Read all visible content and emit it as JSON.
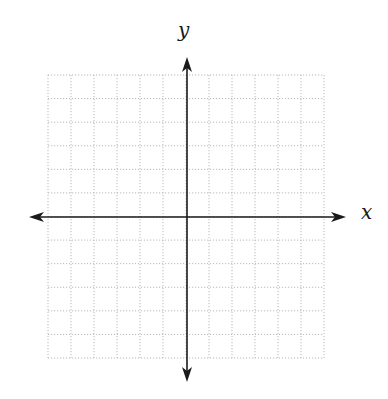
{
  "diagram": {
    "type": "coordinate-plane",
    "x_axis_label": "x",
    "y_axis_label": "y",
    "grid": {
      "columns": 12,
      "rows": 12,
      "left": 48,
      "top": 75,
      "right": 324,
      "bottom": 358,
      "line_style": "dotted",
      "line_color": "#b8b8b8"
    },
    "axes": {
      "color": "#1a1a1a",
      "x_axis": {
        "y": 217,
        "x_start": 29,
        "x_end": 346,
        "arrows": "both"
      },
      "y_axis": {
        "x": 187,
        "y_start": 57,
        "y_end": 382,
        "arrows": "both"
      }
    }
  }
}
